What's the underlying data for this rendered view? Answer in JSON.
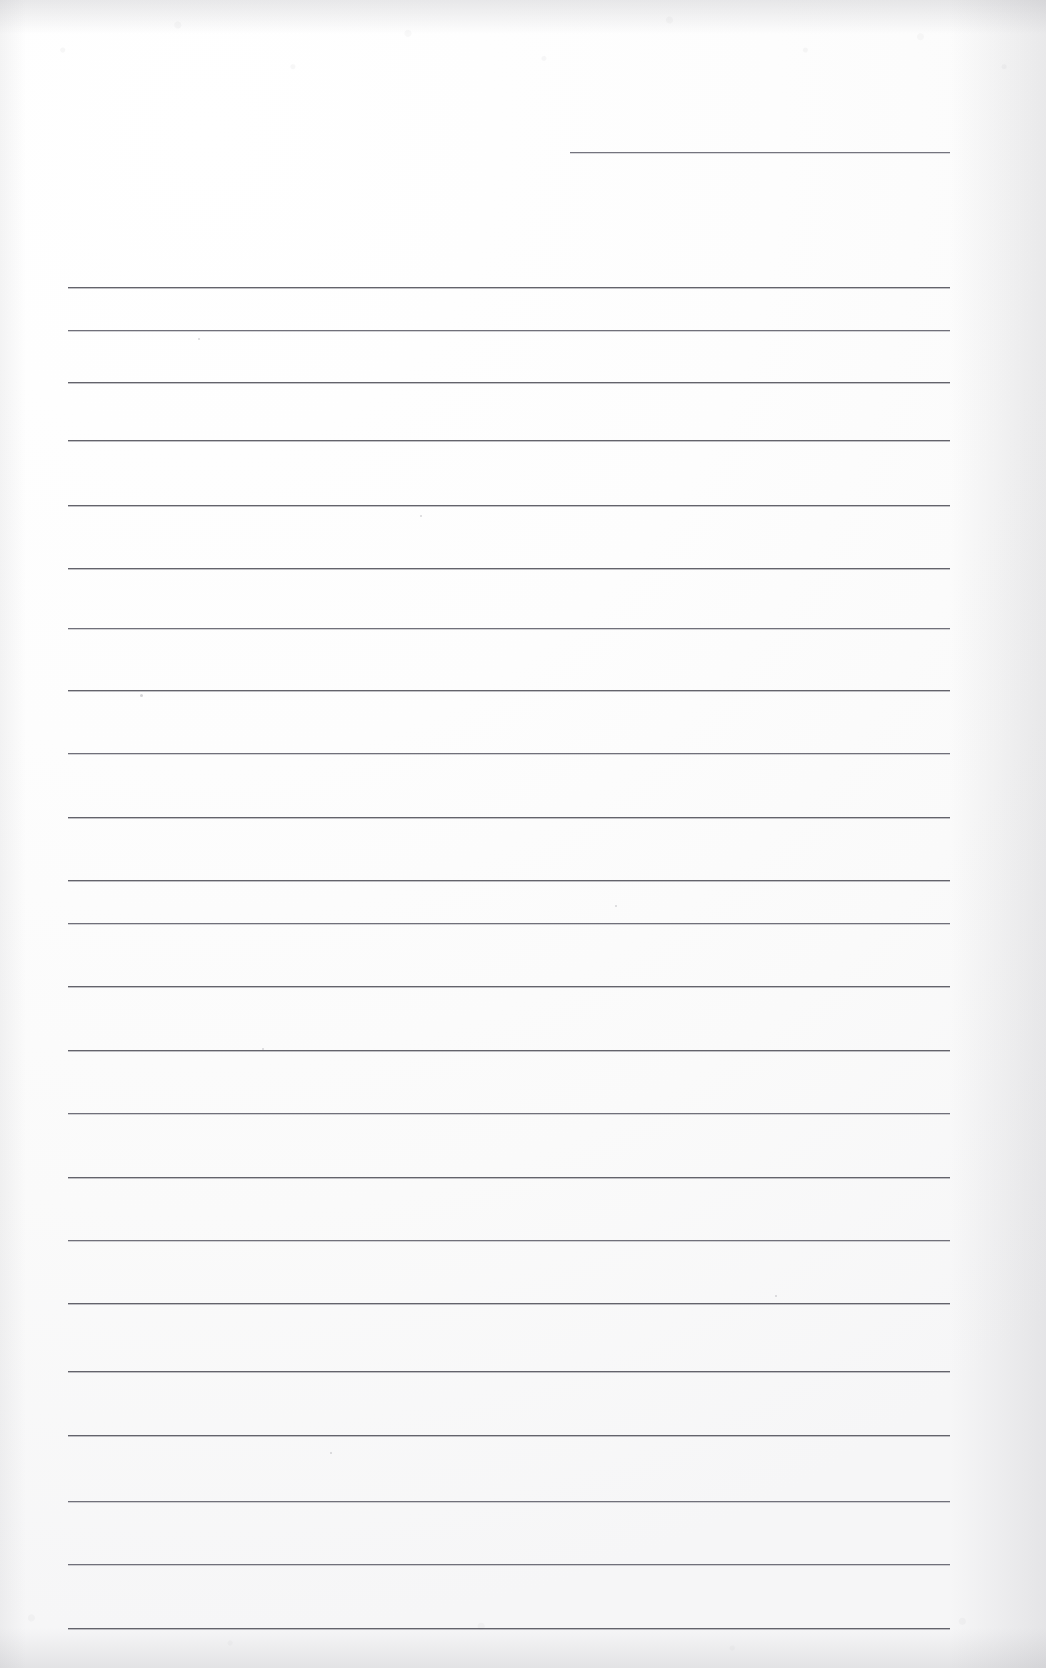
{
  "document": {
    "type": "scanned-blank-lined-paper",
    "title": "Blank ruled notebook page",
    "page_width": 1046,
    "page_height": 1668,
    "background_color": "#fdfdfd",
    "rule_color": "#63636b",
    "rule_thickness_px": 1,
    "visible_text": "",
    "notes": "No printed or handwritten text is present on the page."
  },
  "ruling": {
    "left_margin_x": 68,
    "right_margin_x": 950,
    "line_spacing_px": 63.5,
    "full_width_line_count": 21,
    "partial_line_count": 1,
    "partial_line": {
      "label": "top-right short rule",
      "x_start": 570,
      "x_end": 950,
      "y": 152
    },
    "lines": [
      {
        "y": 287,
        "x_start": 68,
        "x_end": 950,
        "weight": "normal"
      },
      {
        "y": 330,
        "x_start": 68,
        "x_end": 950,
        "weight": "soft"
      },
      {
        "y": 382,
        "x_start": 68,
        "x_end": 950,
        "weight": "normal"
      },
      {
        "y": 440,
        "x_start": 68,
        "x_end": 950,
        "weight": "normal"
      },
      {
        "y": 505,
        "x_start": 68,
        "x_end": 950,
        "weight": "normal"
      },
      {
        "y": 568,
        "x_start": 68,
        "x_end": 950,
        "weight": "normal"
      },
      {
        "y": 628,
        "x_start": 68,
        "x_end": 950,
        "weight": "soft"
      },
      {
        "y": 690,
        "x_start": 68,
        "x_end": 950,
        "weight": "normal"
      },
      {
        "y": 753,
        "x_start": 68,
        "x_end": 950,
        "weight": "soft"
      },
      {
        "y": 817,
        "x_start": 68,
        "x_end": 950,
        "weight": "normal"
      },
      {
        "y": 880,
        "x_start": 68,
        "x_end": 950,
        "weight": "normal"
      },
      {
        "y": 923,
        "x_start": 68,
        "x_end": 950,
        "weight": "soft"
      },
      {
        "y": 986,
        "x_start": 68,
        "x_end": 950,
        "weight": "normal"
      },
      {
        "y": 1050,
        "x_start": 68,
        "x_end": 950,
        "weight": "normal"
      },
      {
        "y": 1113,
        "x_start": 68,
        "x_end": 950,
        "weight": "soft"
      },
      {
        "y": 1177,
        "x_start": 68,
        "x_end": 950,
        "weight": "normal"
      },
      {
        "y": 1240,
        "x_start": 68,
        "x_end": 950,
        "weight": "soft"
      },
      {
        "y": 1303,
        "x_start": 68,
        "x_end": 950,
        "weight": "normal"
      },
      {
        "y": 1371,
        "x_start": 68,
        "x_end": 950,
        "weight": "normal"
      },
      {
        "y": 1435,
        "x_start": 68,
        "x_end": 950,
        "weight": "normal"
      },
      {
        "y": 1501,
        "x_start": 68,
        "x_end": 950,
        "weight": "soft"
      },
      {
        "y": 1564,
        "x_start": 68,
        "x_end": 950,
        "weight": "soft"
      },
      {
        "y": 1628,
        "x_start": 68,
        "x_end": 950,
        "weight": "normal"
      }
    ]
  },
  "artifacts": {
    "specks": [
      {
        "x": 140,
        "y": 694,
        "size": 3
      },
      {
        "x": 198,
        "y": 338,
        "size": 2
      },
      {
        "x": 420,
        "y": 515,
        "size": 2
      },
      {
        "x": 262,
        "y": 1048,
        "size": 2
      },
      {
        "x": 615,
        "y": 905,
        "size": 2
      },
      {
        "x": 775,
        "y": 1295,
        "size": 2
      },
      {
        "x": 330,
        "y": 1452,
        "size": 2
      }
    ]
  }
}
